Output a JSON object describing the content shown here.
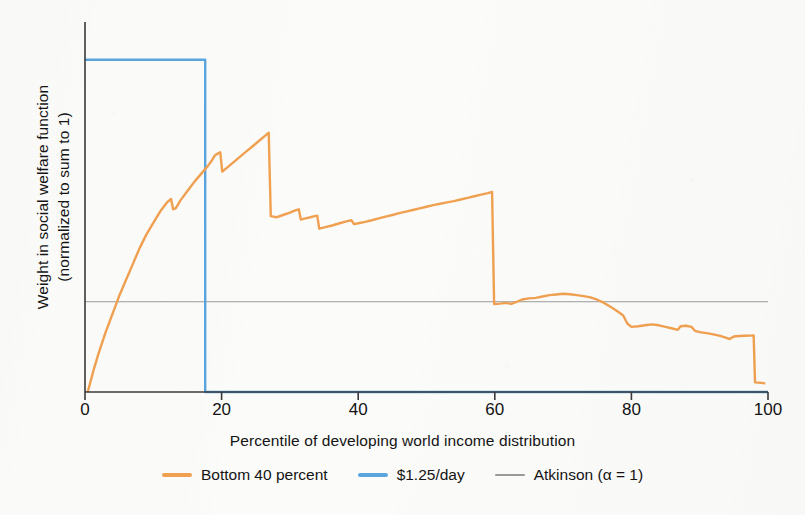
{
  "chart_data": {
    "type": "line",
    "title": "",
    "xlabel": "Percentile of developing world income distribution",
    "ylabel": "Weight in social welfare function (normalized to sum to 1)",
    "ylabel_line1": "Weight in social welfare function",
    "ylabel_line2": "(normalized to sum to 1)",
    "xlim": [
      0,
      100
    ],
    "ylim": [
      0,
      1.62
    ],
    "xticks": [
      0,
      20,
      40,
      60,
      80,
      100
    ],
    "xtick_labels": [
      "0",
      "20",
      "40",
      "60",
      "80",
      "100"
    ],
    "yticks": [],
    "ytick_labels": [],
    "grid": false,
    "legend_position": "bottom-center",
    "series": [
      {
        "name": "Bottom 40 percent",
        "color": "#f0a050",
        "style": "solid",
        "width": 2.4,
        "points": [
          [
            0.4,
            0.0
          ],
          [
            1.2,
            0.09
          ],
          [
            2.0,
            0.17
          ],
          [
            3.0,
            0.26
          ],
          [
            4.0,
            0.34
          ],
          [
            5.0,
            0.42
          ],
          [
            6.0,
            0.49
          ],
          [
            7.0,
            0.56
          ],
          [
            8.0,
            0.63
          ],
          [
            9.0,
            0.69
          ],
          [
            10.0,
            0.74
          ],
          [
            11.0,
            0.79
          ],
          [
            12.0,
            0.83
          ],
          [
            12.6,
            0.845
          ],
          [
            12.9,
            0.8
          ],
          [
            13.3,
            0.805
          ],
          [
            14.0,
            0.84
          ],
          [
            15.0,
            0.88
          ],
          [
            16.0,
            0.92
          ],
          [
            17.0,
            0.955
          ],
          [
            18.0,
            0.99
          ],
          [
            18.6,
            1.015
          ],
          [
            19.0,
            1.035
          ],
          [
            19.5,
            1.045
          ],
          [
            19.8,
            1.05
          ],
          [
            20.1,
            0.965
          ],
          [
            20.5,
            0.975
          ],
          [
            21.5,
            1.0
          ],
          [
            22.5,
            1.025
          ],
          [
            23.5,
            1.05
          ],
          [
            24.5,
            1.075
          ],
          [
            25.5,
            1.1
          ],
          [
            26.3,
            1.12
          ],
          [
            26.9,
            1.135
          ],
          [
            27.2,
            0.77
          ],
          [
            28.0,
            0.765
          ],
          [
            29.0,
            0.775
          ],
          [
            30.0,
            0.785
          ],
          [
            30.8,
            0.795
          ],
          [
            31.3,
            0.8
          ],
          [
            31.6,
            0.755
          ],
          [
            32.3,
            0.76
          ],
          [
            33.0,
            0.765
          ],
          [
            33.6,
            0.77
          ],
          [
            34.0,
            0.772
          ],
          [
            34.3,
            0.715
          ],
          [
            35.2,
            0.722
          ],
          [
            36.3,
            0.73
          ],
          [
            37.4,
            0.74
          ],
          [
            38.4,
            0.748
          ],
          [
            39.0,
            0.752
          ],
          [
            39.4,
            0.735
          ],
          [
            40.2,
            0.74
          ],
          [
            41.0,
            0.745
          ],
          [
            42.0,
            0.752
          ],
          [
            43.0,
            0.76
          ],
          [
            44.0,
            0.768
          ],
          [
            45.0,
            0.775
          ],
          [
            46.0,
            0.783
          ],
          [
            47.0,
            0.79
          ],
          [
            48.0,
            0.797
          ],
          [
            49.0,
            0.804
          ],
          [
            50.0,
            0.811
          ],
          [
            51.0,
            0.818
          ],
          [
            52.0,
            0.824
          ],
          [
            53.0,
            0.83
          ],
          [
            54.0,
            0.836
          ],
          [
            55.0,
            0.843
          ],
          [
            56.0,
            0.85
          ],
          [
            57.0,
            0.857
          ],
          [
            58.0,
            0.864
          ],
          [
            59.0,
            0.871
          ],
          [
            59.6,
            0.876
          ],
          [
            59.9,
            0.385
          ],
          [
            60.8,
            0.387
          ],
          [
            61.6,
            0.39
          ],
          [
            62.4,
            0.386
          ],
          [
            63.2,
            0.395
          ],
          [
            64.0,
            0.405
          ],
          [
            65.0,
            0.41
          ],
          [
            66.0,
            0.412
          ],
          [
            67.0,
            0.418
          ],
          [
            68.0,
            0.424
          ],
          [
            69.0,
            0.427
          ],
          [
            70.0,
            0.43
          ],
          [
            71.0,
            0.428
          ],
          [
            72.0,
            0.424
          ],
          [
            73.0,
            0.42
          ],
          [
            74.0,
            0.414
          ],
          [
            75.0,
            0.404
          ],
          [
            76.0,
            0.39
          ],
          [
            77.0,
            0.372
          ],
          [
            78.0,
            0.352
          ],
          [
            78.8,
            0.335
          ],
          [
            79.4,
            0.3
          ],
          [
            80.0,
            0.285
          ],
          [
            81.0,
            0.288
          ],
          [
            82.0,
            0.292
          ],
          [
            83.0,
            0.296
          ],
          [
            84.0,
            0.292
          ],
          [
            85.0,
            0.285
          ],
          [
            86.0,
            0.278
          ],
          [
            86.8,
            0.272
          ],
          [
            87.2,
            0.288
          ],
          [
            88.0,
            0.29
          ],
          [
            88.8,
            0.285
          ],
          [
            89.3,
            0.268
          ],
          [
            90.0,
            0.262
          ],
          [
            91.0,
            0.258
          ],
          [
            92.0,
            0.252
          ],
          [
            93.0,
            0.246
          ],
          [
            93.8,
            0.238
          ],
          [
            94.4,
            0.232
          ],
          [
            95.0,
            0.243
          ],
          [
            95.8,
            0.245
          ],
          [
            96.6,
            0.246
          ],
          [
            97.4,
            0.247
          ],
          [
            97.9,
            0.248
          ],
          [
            98.1,
            0.042
          ],
          [
            99.0,
            0.04
          ],
          [
            99.6,
            0.038
          ]
        ]
      },
      {
        "name": "$1.25/day",
        "color": "#5aa5de",
        "style": "solid",
        "width": 2.4,
        "points": [
          [
            0.0,
            1.455
          ],
          [
            17.6,
            1.455
          ],
          [
            17.6,
            0.0
          ],
          [
            100.0,
            0.0
          ]
        ]
      },
      {
        "name": "Atkinson (α = 1)",
        "color": "#9a9a9a",
        "style": "solid",
        "width": 1.1,
        "points": [
          [
            0.0,
            0.395
          ],
          [
            100.0,
            0.395
          ]
        ]
      }
    ],
    "annotations": []
  },
  "axes": {
    "x_title": "Percentile of developing world income distribution",
    "y_title_line1": "Weight in social welfare function",
    "y_title_line2": "(normalized to sum to 1)",
    "x_tick_labels": [
      "0",
      "20",
      "40",
      "60",
      "80",
      "100"
    ]
  },
  "legend": {
    "items": [
      {
        "label": "Bottom 40 percent",
        "color": "#f0a050",
        "thin": false
      },
      {
        "label": "$1.25/day",
        "color": "#5aa5de",
        "thin": false
      },
      {
        "label": "Atkinson (α = 1)",
        "color": "#9a9a9a",
        "thin": true
      }
    ]
  },
  "colors": {
    "background": "#fbfbf9",
    "axis": "#3a3a3a",
    "orange": "#f0a050",
    "blue": "#5aa5de",
    "gray": "#9a9a9a",
    "text": "#141414"
  }
}
